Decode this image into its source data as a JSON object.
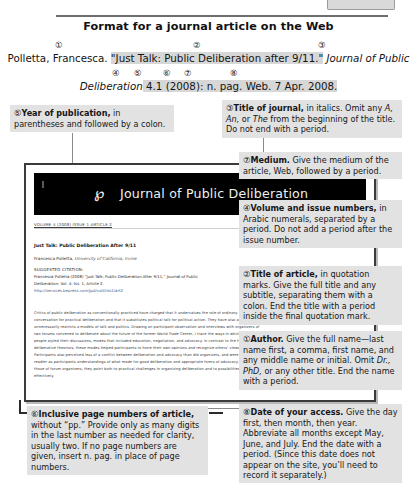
{
  "page": {
    "title": "Format for a journal article on the Web"
  },
  "citation_model": {
    "line1_parts": [
      {
        "text": "Polletta, Francesca. ",
        "style": "plain",
        "highlight": false
      },
      {
        "text": "\"Just Talk: Public Deliberation after 9/11.\"",
        "style": "plain",
        "highlight": true
      },
      {
        "text": " ",
        "style": "plain",
        "highlight": false
      },
      {
        "text": "Journal of Public",
        "style": "italic",
        "highlight": false
      }
    ],
    "line1_plain": "Polletta, Francesca. \"Just Talk: Public Deliberation after 9/11.\" Journal of Public",
    "line2_parts": [
      {
        "text": "Deliberation",
        "style": "italic",
        "highlight": false
      },
      {
        "text": " 4.1 (2008): n. pag. Web. 7 Apr. 2008.",
        "style": "plain",
        "highlight": true
      }
    ],
    "line2_plain": "Deliberation 4.1 (2008): n. pag. Web. 7 Apr. 2008.",
    "markers_line1": [
      {
        "label": "①",
        "left": 55
      },
      {
        "label": "②",
        "left": 193
      },
      {
        "label": "③",
        "left": 318
      }
    ],
    "markers_line2": [
      {
        "label": "④",
        "left": 112
      },
      {
        "label": "⑤",
        "left": 134
      },
      {
        "label": "⑥",
        "left": 163
      },
      {
        "label": "⑦",
        "left": 184
      },
      {
        "label": "⑧",
        "left": 230
      }
    ]
  },
  "callouts": {
    "one": {
      "num": "①",
      "lead": "Author.",
      "body_pre": " Give the full name—last name first, a comma, first name, and any middle name or initial. Omit ",
      "italic_1": "Dr., PhD,",
      "body_post": " or any other title. End the name with a period."
    },
    "two": {
      "num": "②",
      "lead": "Title of article,",
      "body": " in quotation marks. Give the full title and any subtitle, separating them with a colon. End the title with a period inside the final quotation mark."
    },
    "three": {
      "num": "③",
      "lead": "Title of journal,",
      "body_pre": " in italics. Omit any ",
      "italic_1": "A, An,",
      "body_mid": " or ",
      "italic_2": "The",
      "body_post": " from the beginning of the title. Do not end with a period."
    },
    "four": {
      "num": "④",
      "lead": "Volume and issue numbers,",
      "body": " in Arabic numerals, separated by a period. Do not add a period after the issue number."
    },
    "five": {
      "num": "⑤",
      "lead": "Year of publication,",
      "body": " in parentheses and followed by a colon."
    },
    "six": {
      "num": "⑥",
      "lead": "Inclusive page numbers of article,",
      "body": " without “pp.” Provide only as many digits in the last number as needed for clarity, usually two. If no page numbers are given, insert n. pag. in place of page numbers."
    },
    "seven": {
      "num": "⑦",
      "lead": "Medium.",
      "body": " Give the medium of the article, Web, followed by a period."
    },
    "eight": {
      "num": "⑧",
      "lead": "Date of your access.",
      "body": " Give the day first, then month, then year. Abbreviate all months except May, June, and July. End the date with a period. (Since this date does not appear on the site, you’ll need to record it separately.)"
    }
  },
  "screenshot": {
    "banner_title": "Journal of Public Deliberation",
    "logo_text": "℘",
    "breadcrumb": "VOLUME 4 (2008)  ISSUE 1  ARTICLE 2",
    "article_title": "Just Talk: Public Deliberation After 9/11",
    "article_author": "Francesca Polletta,",
    "article_affiliation": " University of California, Irvine",
    "citation_heading": "SUGGESTED CITATION:",
    "citation_line1": "Francesca Polletta (2008) “Just Talk: Public Deliberation After 9/11,” Journal of Public",
    "citation_line2": "Deliberation: Vol. 4: Iss. 1, Article 2.",
    "citation_url": "http://services.bepress.com/jpd/vol4/iss1/art2",
    "abstract_lines": [
      "Critics of public deliberation as conventionally practiced have charged that it undervalues the role of ordinary",
      "conversation for practical deliberation and that it substitutes political talk for political action. They have also argued that it",
      "unnecessarily restricts a models of talk and politics. Drawing on participant observation and interviews with organizers of",
      "two forums convened to deliberate about the future of the former World Trade Center, I trace the ways in which",
      "people styled their discussions, modes that included education, negotiation, and advocacy. In contrast to the fears of",
      "deliberative theorists, these modes helped participants to hone their own opinions and recognize others’ views.",
      "Participants also perceived less of a conflict between deliberation and advocacy than did organizers, and were",
      "readier as participants understandings of what made for good deliberation and appropriate forms of advocacy. To the extent that",
      "those of forum organizers, they point both to practical challenges in organizing deliberation and to possibilities for organizing it more",
      "effectively."
    ]
  }
}
